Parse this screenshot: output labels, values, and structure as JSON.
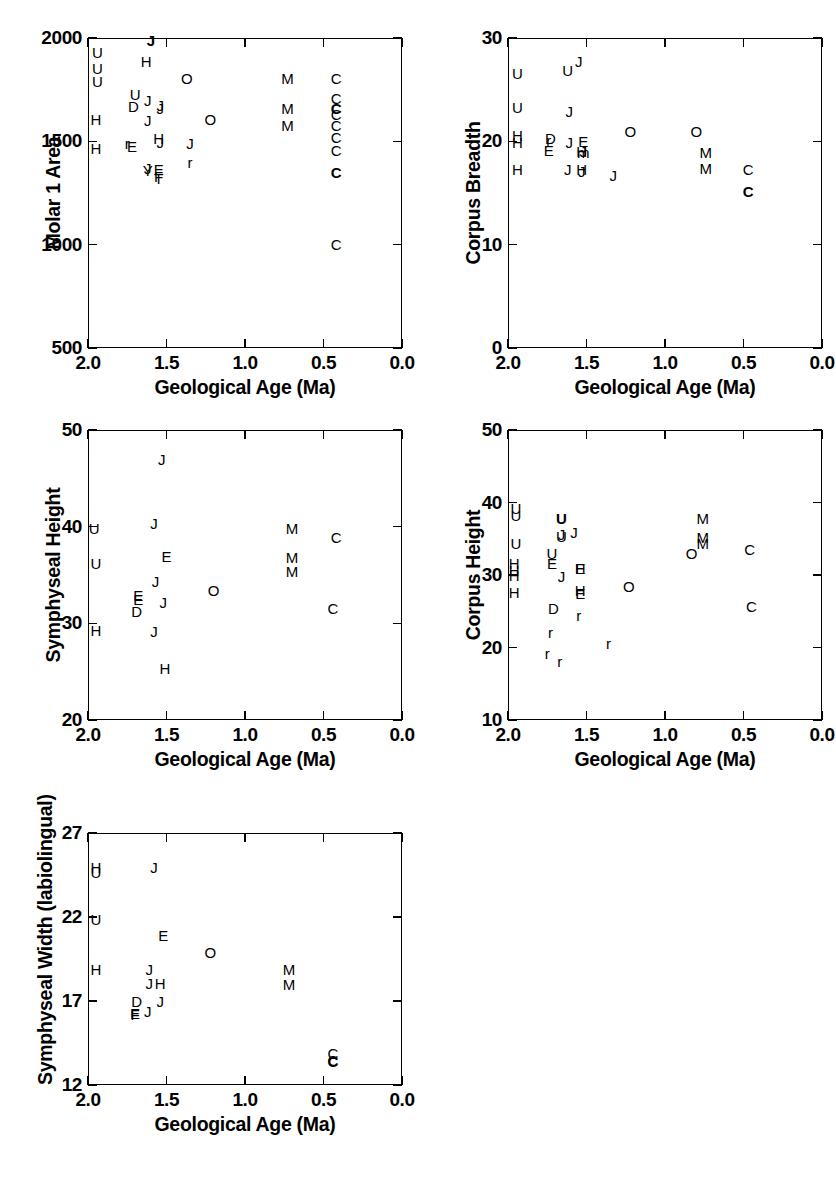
{
  "figure": {
    "type": "scatter-matrix",
    "panel_count": 5,
    "shared_xlabel": "Geological Age (Ma)",
    "shared_xlim": [
      2.0,
      0.0
    ],
    "shared_xticks": [
      "2.0",
      "1.5",
      "1.0",
      "0.5",
      "0.0"
    ],
    "marker_style": "text-letter-codes",
    "axis_color": "#000000",
    "background_color": "#ffffff"
  },
  "chart_data": [
    {
      "type": "scatter",
      "id": "molar-1-area",
      "title": "",
      "xlabel": "Geological Age (Ma)",
      "ylabel": "Molar 1 Area",
      "xlim": [
        2.0,
        0.0
      ],
      "ylim": [
        500,
        2000
      ],
      "xticks": [
        2.0,
        1.5,
        1.0,
        0.5,
        0.0
      ],
      "xtick_labels": [
        "2.0",
        "1.5",
        "1.0",
        "0.5",
        "0.0"
      ],
      "yticks": [
        500,
        1000,
        1500,
        2000
      ],
      "ytick_labels": [
        "500",
        "1000",
        "1500",
        "2000"
      ],
      "grid": false,
      "legend": "none",
      "points": [
        {
          "label": "U",
          "x": 1.94,
          "y": 1930
        },
        {
          "label": "U",
          "x": 1.94,
          "y": 1855
        },
        {
          "label": "U",
          "x": 1.94,
          "y": 1790
        },
        {
          "label": "H",
          "x": 1.95,
          "y": 1608
        },
        {
          "label": "H",
          "x": 1.95,
          "y": 1466
        },
        {
          "label": "J",
          "x": 1.6,
          "y": 1988,
          "bold": true
        },
        {
          "label": "H",
          "x": 1.63,
          "y": 1890
        },
        {
          "label": "U",
          "x": 1.7,
          "y": 1730
        },
        {
          "label": "D",
          "x": 1.71,
          "y": 1672
        },
        {
          "label": "J",
          "x": 1.62,
          "y": 1700
        },
        {
          "label": "J",
          "x": 1.62,
          "y": 1605
        },
        {
          "label": "J",
          "x": 1.54,
          "y": 1678
        },
        {
          "label": "J",
          "x": 1.54,
          "y": 1660
        },
        {
          "label": "E",
          "x": 1.72,
          "y": 1478
        },
        {
          "label": "r",
          "x": 1.75,
          "y": 1492
        },
        {
          "label": "H",
          "x": 1.55,
          "y": 1515
        },
        {
          "label": "J",
          "x": 1.54,
          "y": 1498
        },
        {
          "label": "J",
          "x": 1.62,
          "y": 1372
        },
        {
          "label": "Y",
          "x": 1.62,
          "y": 1360
        },
        {
          "label": "E",
          "x": 1.55,
          "y": 1368
        },
        {
          "label": "F",
          "x": 1.55,
          "y": 1330
        },
        {
          "label": "T",
          "x": 1.55,
          "y": 1322
        },
        {
          "label": "O",
          "x": 1.37,
          "y": 1805
        },
        {
          "label": "O",
          "x": 1.22,
          "y": 1610
        },
        {
          "label": "J",
          "x": 1.35,
          "y": 1492
        },
        {
          "label": "r",
          "x": 1.35,
          "y": 1400
        },
        {
          "label": "M",
          "x": 0.73,
          "y": 1805
        },
        {
          "label": "M",
          "x": 0.73,
          "y": 1660
        },
        {
          "label": "M",
          "x": 0.73,
          "y": 1580
        },
        {
          "label": "C",
          "x": 0.42,
          "y": 1805
        },
        {
          "label": "C",
          "x": 0.42,
          "y": 1710
        },
        {
          "label": "C",
          "x": 0.42,
          "y": 1660,
          "bold": true
        },
        {
          "label": "C",
          "x": 0.42,
          "y": 1632
        },
        {
          "label": "C",
          "x": 0.42,
          "y": 1578
        },
        {
          "label": "C",
          "x": 0.42,
          "y": 1520
        },
        {
          "label": "C",
          "x": 0.42,
          "y": 1460
        },
        {
          "label": "C",
          "x": 0.42,
          "y": 1352,
          "bold": true
        },
        {
          "label": "C",
          "x": 0.42,
          "y": 1002
        }
      ]
    },
    {
      "type": "scatter",
      "id": "corpus-breadth",
      "title": "",
      "xlabel": "Geological Age (Ma)",
      "ylabel": "Corpus Breadth",
      "xlim": [
        2.0,
        0.0
      ],
      "ylim": [
        0,
        30
      ],
      "xticks": [
        2.0,
        1.5,
        1.0,
        0.5,
        0.0
      ],
      "xtick_labels": [
        "2.0",
        "1.5",
        "1.0",
        "0.5",
        "0.0"
      ],
      "yticks": [
        0,
        10,
        20,
        30
      ],
      "ytick_labels": [
        "0",
        "10",
        "20",
        "30"
      ],
      "grid": false,
      "legend": "none",
      "points": [
        {
          "label": "U",
          "x": 1.94,
          "y": 26.6
        },
        {
          "label": "U",
          "x": 1.94,
          "y": 23.3
        },
        {
          "label": "H",
          "x": 1.94,
          "y": 20.6
        },
        {
          "label": "H",
          "x": 1.94,
          "y": 19.9
        },
        {
          "label": "H",
          "x": 1.94,
          "y": 17.3
        },
        {
          "label": "U",
          "x": 1.62,
          "y": 26.9
        },
        {
          "label": "J",
          "x": 1.55,
          "y": 27.8
        },
        {
          "label": "J",
          "x": 1.61,
          "y": 22.9
        },
        {
          "label": "D",
          "x": 1.73,
          "y": 20.3
        },
        {
          "label": "r",
          "x": 1.74,
          "y": 20.1
        },
        {
          "label": "E",
          "x": 1.74,
          "y": 19.2
        },
        {
          "label": "J",
          "x": 1.61,
          "y": 19.9
        },
        {
          "label": "J",
          "x": 1.62,
          "y": 17.3
        },
        {
          "label": "E",
          "x": 1.52,
          "y": 20.0
        },
        {
          "label": "J",
          "x": 1.52,
          "y": 19.1
        },
        {
          "label": "m",
          "x": 1.52,
          "y": 19.0
        },
        {
          "label": "H",
          "x": 1.53,
          "y": 19.1
        },
        {
          "label": "H",
          "x": 1.53,
          "y": 17.3
        },
        {
          "label": "J",
          "x": 1.53,
          "y": 17.1
        },
        {
          "label": "J",
          "x": 1.33,
          "y": 16.7
        },
        {
          "label": "O",
          "x": 1.22,
          "y": 21.0
        },
        {
          "label": "O",
          "x": 0.8,
          "y": 21.0
        },
        {
          "label": "M",
          "x": 0.74,
          "y": 19.0
        },
        {
          "label": "M",
          "x": 0.74,
          "y": 17.4
        },
        {
          "label": "C",
          "x": 0.47,
          "y": 17.3
        },
        {
          "label": "C",
          "x": 0.47,
          "y": 15.2,
          "bold": true
        }
      ]
    },
    {
      "type": "scatter",
      "id": "symphyseal-height",
      "title": "",
      "xlabel": "Geological Age (Ma)",
      "ylabel": "Symphyseal Height",
      "xlim": [
        2.0,
        0.0
      ],
      "ylim": [
        20,
        50
      ],
      "xticks": [
        2.0,
        1.5,
        1.0,
        0.5,
        0.0
      ],
      "xtick_labels": [
        "2.0",
        "1.5",
        "1.0",
        "0.5",
        "0.0"
      ],
      "yticks": [
        20,
        30,
        40,
        50
      ],
      "ytick_labels": [
        "20",
        "30",
        "40",
        "50"
      ],
      "grid": false,
      "legend": "none",
      "points": [
        {
          "label": "U",
          "x": 1.96,
          "y": 39.9
        },
        {
          "label": "U",
          "x": 1.95,
          "y": 36.2
        },
        {
          "label": "H",
          "x": 1.95,
          "y": 29.3
        },
        {
          "label": "J",
          "x": 1.53,
          "y": 47.0
        },
        {
          "label": "J",
          "x": 1.58,
          "y": 40.4
        },
        {
          "label": "E",
          "x": 1.5,
          "y": 37.0
        },
        {
          "label": "J",
          "x": 1.57,
          "y": 34.4
        },
        {
          "label": "E",
          "x": 1.68,
          "y": 32.9
        },
        {
          "label": "E",
          "x": 1.68,
          "y": 32.5
        },
        {
          "label": "D",
          "x": 1.69,
          "y": 31.3
        },
        {
          "label": "J",
          "x": 1.52,
          "y": 32.2
        },
        {
          "label": "J",
          "x": 1.58,
          "y": 29.2
        },
        {
          "label": "H",
          "x": 1.51,
          "y": 25.4
        },
        {
          "label": "O",
          "x": 1.2,
          "y": 33.5
        },
        {
          "label": "M",
          "x": 0.7,
          "y": 39.9
        },
        {
          "label": "M",
          "x": 0.7,
          "y": 36.9
        },
        {
          "label": "M",
          "x": 0.7,
          "y": 35.4
        },
        {
          "label": "C",
          "x": 0.42,
          "y": 38.9
        },
        {
          "label": "C",
          "x": 0.44,
          "y": 31.6
        }
      ]
    },
    {
      "type": "scatter",
      "id": "corpus-height",
      "title": "",
      "xlabel": "Geological Age (Ma)",
      "ylabel": "Corpus Height",
      "xlim": [
        2.0,
        0.0
      ],
      "ylim": [
        10,
        50
      ],
      "xticks": [
        2.0,
        1.5,
        1.0,
        0.5,
        0.0
      ],
      "xtick_labels": [
        "2.0",
        "1.5",
        "1.0",
        "0.5",
        "0.0"
      ],
      "yticks": [
        10,
        20,
        30,
        40,
        50
      ],
      "ytick_labels": [
        "10",
        "20",
        "30",
        "40",
        "50"
      ],
      "grid": false,
      "legend": "none",
      "points": [
        {
          "label": "U",
          "x": 1.95,
          "y": 39.2
        },
        {
          "label": "U",
          "x": 1.95,
          "y": 38.3
        },
        {
          "label": "U",
          "x": 1.95,
          "y": 34.4
        },
        {
          "label": "H",
          "x": 1.96,
          "y": 31.6
        },
        {
          "label": "H",
          "x": 1.96,
          "y": 30.7
        },
        {
          "label": "H",
          "x": 1.96,
          "y": 30.0
        },
        {
          "label": "H",
          "x": 1.96,
          "y": 27.6
        },
        {
          "label": "U",
          "x": 1.66,
          "y": 37.9,
          "bold": true
        },
        {
          "label": "J",
          "x": 1.66,
          "y": 35.6
        },
        {
          "label": "U",
          "x": 1.66,
          "y": 35.4
        },
        {
          "label": "J",
          "x": 1.58,
          "y": 35.9
        },
        {
          "label": "U",
          "x": 1.72,
          "y": 33.0
        },
        {
          "label": "E",
          "x": 1.72,
          "y": 31.6
        },
        {
          "label": "J",
          "x": 1.66,
          "y": 29.8
        },
        {
          "label": "E",
          "x": 1.54,
          "y": 31.0
        },
        {
          "label": "H",
          "x": 1.54,
          "y": 30.9
        },
        {
          "label": "H",
          "x": 1.54,
          "y": 28.0
        },
        {
          "label": "E",
          "x": 1.54,
          "y": 27.5
        },
        {
          "label": "D",
          "x": 1.71,
          "y": 25.5
        },
        {
          "label": "r",
          "x": 1.55,
          "y": 24.5
        },
        {
          "label": "r",
          "x": 1.73,
          "y": 22.1
        },
        {
          "label": "r",
          "x": 1.75,
          "y": 19.3
        },
        {
          "label": "r",
          "x": 1.67,
          "y": 18.2
        },
        {
          "label": "r",
          "x": 1.36,
          "y": 20.6
        },
        {
          "label": "O",
          "x": 1.23,
          "y": 28.5
        },
        {
          "label": "O",
          "x": 0.83,
          "y": 33.1
        },
        {
          "label": "M",
          "x": 0.76,
          "y": 37.9
        },
        {
          "label": "M",
          "x": 0.76,
          "y": 35.2
        },
        {
          "label": "M",
          "x": 0.76,
          "y": 34.4
        },
        {
          "label": "C",
          "x": 0.46,
          "y": 33.6
        },
        {
          "label": "C",
          "x": 0.45,
          "y": 25.7
        }
      ]
    },
    {
      "type": "scatter",
      "id": "symphyseal-width-labiolingual",
      "title": "",
      "xlabel": "Geological Age (Ma)",
      "ylabel": "Symphyseal Width (labiolingual)",
      "xlim": [
        2.0,
        0.0
      ],
      "ylim": [
        12,
        27
      ],
      "xticks": [
        2.0,
        1.5,
        1.0,
        0.5,
        0.0
      ],
      "xtick_labels": [
        "2.0",
        "1.5",
        "1.0",
        "0.5",
        "0.0"
      ],
      "yticks": [
        12,
        17,
        22,
        27
      ],
      "ytick_labels": [
        "12",
        "17",
        "22",
        "27"
      ],
      "grid": false,
      "legend": "none",
      "points": [
        {
          "label": "H",
          "x": 1.95,
          "y": 25.0
        },
        {
          "label": "U",
          "x": 1.95,
          "y": 24.7
        },
        {
          "label": "U",
          "x": 1.95,
          "y": 21.9
        },
        {
          "label": "H",
          "x": 1.95,
          "y": 18.9
        },
        {
          "label": "J",
          "x": 1.58,
          "y": 25.0
        },
        {
          "label": "E",
          "x": 1.52,
          "y": 20.9
        },
        {
          "label": "J",
          "x": 1.61,
          "y": 18.9
        },
        {
          "label": "J",
          "x": 1.61,
          "y": 18.1
        },
        {
          "label": "H",
          "x": 1.54,
          "y": 18.1
        },
        {
          "label": "D",
          "x": 1.69,
          "y": 17.0
        },
        {
          "label": "J",
          "x": 1.54,
          "y": 17.0
        },
        {
          "label": "E",
          "x": 1.7,
          "y": 16.3
        },
        {
          "label": "F",
          "x": 1.7,
          "y": 16.2
        },
        {
          "label": "J",
          "x": 1.62,
          "y": 16.4
        },
        {
          "label": "O",
          "x": 1.22,
          "y": 19.9
        },
        {
          "label": "M",
          "x": 0.72,
          "y": 18.9
        },
        {
          "label": "M",
          "x": 0.72,
          "y": 18.0
        },
        {
          "label": "C",
          "x": 0.44,
          "y": 13.9
        },
        {
          "label": "C",
          "x": 0.44,
          "y": 13.5
        },
        {
          "label": "C",
          "x": 0.44,
          "y": 13.4,
          "bold": true
        }
      ]
    }
  ]
}
